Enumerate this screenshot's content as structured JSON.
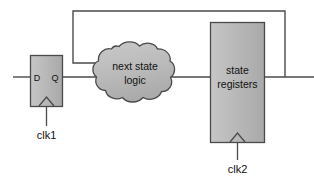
{
  "diagram": {
    "canvas": {
      "width": 314,
      "height": 180,
      "background": "#ffffff"
    },
    "colors": {
      "block_fill": "#b5b5b5",
      "block_fill_light": "#c9c9c9",
      "block_stroke": "#4a4a4a",
      "cloud_fill": "#bdbdbd",
      "cloud_stroke": "#4a4a4a",
      "wire": "#4a4a4a",
      "text": "#111111"
    },
    "flipflop": {
      "name": "d-flip-flop",
      "port_d": "D",
      "port_q": "Q",
      "clock_label": "clk1",
      "clock_glyph": "^"
    },
    "cloud": {
      "name": "next-state-logic",
      "line1": "next state",
      "line2": "logic"
    },
    "registers": {
      "name": "state-registers",
      "line1": "state",
      "line2": "registers",
      "clock_label": "clk2",
      "clock_glyph": "^"
    },
    "wires": {
      "input": "input-wire",
      "q_to_cloud": "q-to-cloud-wire",
      "cloud_to_registers": "cloud-to-registers-wire",
      "registers_output": "registers-output-wire",
      "feedback": "feedback-wire"
    }
  }
}
